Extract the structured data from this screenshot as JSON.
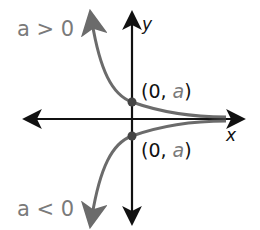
{
  "diagram": {
    "axes": {
      "x_label": "x",
      "y_label": "y"
    },
    "curves": [
      {
        "name": "upper",
        "condition": "a > 0",
        "point_label_open": "(0, ",
        "point_label_var": "a",
        "point_label_close": ")"
      },
      {
        "name": "lower",
        "condition": "a < 0",
        "point_label_open": "(0, ",
        "point_label_var": "a",
        "point_label_close": ")"
      }
    ],
    "colors": {
      "axis": "#111111",
      "curve": "#6b6b6b",
      "label_gray": "#7a7a7a",
      "text": "#111111"
    }
  }
}
